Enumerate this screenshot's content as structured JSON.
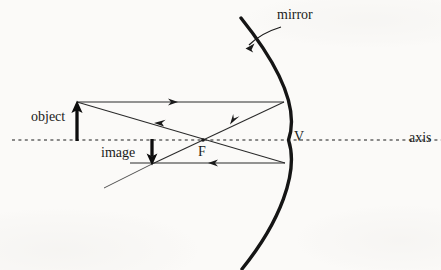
{
  "figure": {
    "kind": "ray-diagram",
    "background_color": "#fbfaf8",
    "ink_color": "#1a1a1a"
  },
  "labels": {
    "mirror": "mirror",
    "object": "object",
    "image": "image",
    "focal_point": "F",
    "vertex": "V",
    "axis": "axis"
  },
  "geometry": {
    "axis_y": 140,
    "axis_x_start": 12,
    "axis_x_end": 441,
    "vertex_x": 288,
    "focal_x": 203,
    "object_x": 77,
    "object_top_y": 102,
    "image_x": 152,
    "image_bottom_y": 164,
    "mirror_top": [
      241,
      18
    ],
    "mirror_bottom": [
      242,
      269
    ],
    "mirror_stroke_width": 3.4,
    "ray_stroke_width": 1.0
  },
  "rays": [
    {
      "name": "parallel-incident-ray",
      "from": [
        77,
        102
      ],
      "to": [
        284,
        102
      ],
      "arrow_at": 0.47,
      "direction": "right"
    },
    {
      "name": "reflected-through-focus-ray",
      "from": [
        284,
        102
      ],
      "to": [
        152,
        164
      ],
      "arrow_at": 0.4,
      "direction": "down-left"
    },
    {
      "name": "through-focus-incident-ray",
      "from": [
        77,
        102
      ],
      "to": [
        285,
        163
      ],
      "arrow_at": 0.38,
      "direction": "down-right"
    },
    {
      "name": "reflected-parallel-ray",
      "from": [
        285,
        163
      ],
      "to": [
        130,
        163
      ],
      "arrow_at": 0.46,
      "direction": "left"
    },
    {
      "name": "extended-construction-ray",
      "from": [
        152,
        164
      ],
      "to": [
        104,
        188
      ],
      "arrow_at": null,
      "direction": "none"
    }
  ],
  "annotations": {
    "mirror_pointer": {
      "name": "mirror-callout-arrow",
      "start": [
        277,
        27
      ],
      "control": [
        262,
        32
      ],
      "end": [
        245,
        48
      ]
    }
  }
}
